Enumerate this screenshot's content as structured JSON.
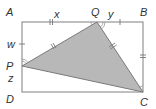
{
  "diagram": {
    "type": "geometry",
    "colors": {
      "background": "#ffffff",
      "line": "#8a8a8a",
      "triangle_fill": "#b8b8b8",
      "triangle_stroke": "#7a7a7a",
      "label": "#333333"
    },
    "points": {
      "A": {
        "label": "A",
        "x": 22,
        "y": 22
      },
      "B": {
        "label": "B",
        "x": 143,
        "y": 22
      },
      "C": {
        "label": "C",
        "x": 143,
        "y": 92
      },
      "D": {
        "label": "D",
        "x": 22,
        "y": 92
      },
      "P": {
        "label": "P",
        "x": 22,
        "y": 66
      },
      "Q": {
        "label": "Q",
        "x": 97,
        "y": 22
      }
    },
    "segment_labels": {
      "AQ": "x",
      "QB": "y",
      "AP": "w",
      "PD": "z"
    },
    "tick_marks": {
      "AQ": 2,
      "QB": 1,
      "AP": 1,
      "BC": 2,
      "PQ": 2,
      "QC": 2
    },
    "shaded_region": "triangle PQC"
  }
}
